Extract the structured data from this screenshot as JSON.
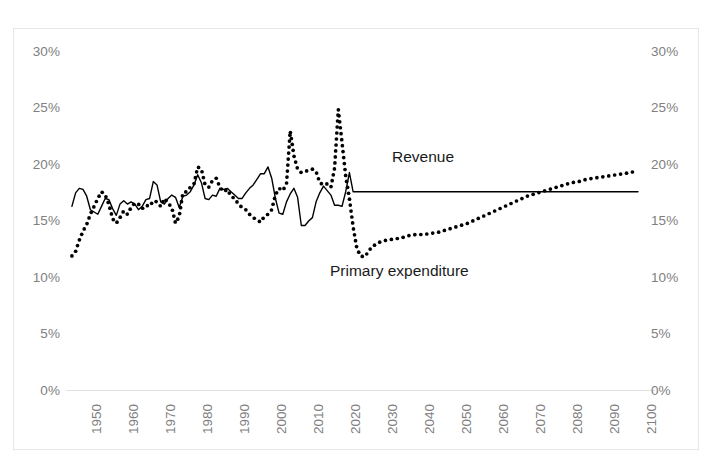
{
  "chart_data": {
    "type": "line",
    "title": "",
    "subtitle": "",
    "xlabel": "",
    "ylabel": "",
    "xlim": [
      1947,
      2100
    ],
    "ylim": [
      0,
      30
    ],
    "grid": false,
    "legend_position": "inline-annotation",
    "y_tick_labels": [
      "30%",
      "25%",
      "20%",
      "15%",
      "10%",
      "5%",
      "0%"
    ],
    "y_ticks": [
      30,
      25,
      20,
      15,
      10,
      5,
      0
    ],
    "y_axis_left_labels": [
      "30%",
      "25%",
      "20%",
      "15%",
      "10%",
      "5%",
      "0%"
    ],
    "y_axis_right_labels": [
      "30%",
      "25%",
      "20%",
      "15%",
      "10%",
      "5%",
      "0%"
    ],
    "x_tick_labels": [
      "1950",
      "1960",
      "1970",
      "1980",
      "1990",
      "2000",
      "2010",
      "2020",
      "2030",
      "2040",
      "2050",
      "2060",
      "2070",
      "2080",
      "2090",
      "2100"
    ],
    "x_ticks": [
      1950,
      1960,
      1970,
      1980,
      1990,
      2000,
      2010,
      2020,
      2030,
      2040,
      2050,
      2060,
      2070,
      2080,
      2090,
      2100
    ],
    "annotations": [
      {
        "text": "Revenue",
        "x": 2038,
        "y": 21.3
      },
      {
        "text": "Primary expenditure",
        "x": 2024,
        "y": 11.0
      }
    ],
    "colors": {
      "revenue_line": "#000000",
      "expenditure_line": "#000000",
      "axis_text": "#808080",
      "frame": "#e6e6e6",
      "background": "#ffffff"
    },
    "series": [
      {
        "name": "Revenue",
        "style": "solid",
        "x": [
          1947,
          1948,
          1949,
          1950,
          1951,
          1952,
          1953,
          1954,
          1955,
          1956,
          1957,
          1958,
          1959,
          1960,
          1961,
          1962,
          1963,
          1964,
          1965,
          1966,
          1967,
          1968,
          1969,
          1970,
          1971,
          1972,
          1973,
          1974,
          1975,
          1976,
          1977,
          1978,
          1979,
          1980,
          1981,
          1982,
          1983,
          1984,
          1985,
          1986,
          1987,
          1988,
          1989,
          1990,
          1991,
          1992,
          1993,
          1994,
          1995,
          1996,
          1997,
          1998,
          1999,
          2000,
          2001,
          2002,
          2003,
          2004,
          2005,
          2006,
          2007,
          2008,
          2009,
          2010,
          2011,
          2012,
          2013,
          2014,
          2015,
          2016,
          2017,
          2018,
          2019,
          2020,
          2021,
          2022,
          2023,
          2024,
          2025,
          2030,
          2035,
          2040,
          2045,
          2050,
          2055,
          2060,
          2065,
          2070,
          2075,
          2080,
          2085,
          2090,
          2095,
          2100
        ],
        "y": [
          16.3,
          17.5,
          17.9,
          17.8,
          17.2,
          16.0,
          15.8,
          15.6,
          16.3,
          17.0,
          16.9,
          16.1,
          15.5,
          16.5,
          16.8,
          16.5,
          16.7,
          16.5,
          16.0,
          16.3,
          16.9,
          17.0,
          18.5,
          18.2,
          16.7,
          16.5,
          17.0,
          17.3,
          17.1,
          16.2,
          17.2,
          17.3,
          17.6,
          18.2,
          19.1,
          18.4,
          17.0,
          16.9,
          17.3,
          17.2,
          17.9,
          17.8,
          17.9,
          17.6,
          17.3,
          17.0,
          17.0,
          17.5,
          17.9,
          18.2,
          18.7,
          19.2,
          19.2,
          19.8,
          18.8,
          17.0,
          15.7,
          15.6,
          16.7,
          17.4,
          17.9,
          17.1,
          14.6,
          14.6,
          15.0,
          15.3,
          16.7,
          17.5,
          18.1,
          17.7,
          17.3,
          16.4,
          16.4,
          16.3,
          17.6,
          19.3,
          17.6,
          17.6,
          17.6,
          17.6,
          17.6,
          17.6,
          17.6,
          17.6,
          17.6,
          17.6,
          17.6,
          17.6,
          17.6,
          17.6,
          17.6,
          17.6,
          17.6,
          17.6
        ]
      },
      {
        "name": "Primary expenditure",
        "style": "dotted",
        "x": [
          1947,
          1948,
          1949,
          1950,
          1951,
          1952,
          1953,
          1954,
          1955,
          1956,
          1957,
          1958,
          1959,
          1960,
          1961,
          1962,
          1963,
          1964,
          1965,
          1966,
          1967,
          1968,
          1969,
          1970,
          1971,
          1972,
          1973,
          1974,
          1975,
          1976,
          1977,
          1978,
          1979,
          1980,
          1981,
          1982,
          1983,
          1984,
          1985,
          1986,
          1987,
          1988,
          1989,
          1990,
          1991,
          1992,
          1993,
          1994,
          1995,
          1996,
          1997,
          1998,
          1999,
          2000,
          2001,
          2002,
          2003,
          2004,
          2005,
          2006,
          2007,
          2008,
          2009,
          2010,
          2011,
          2012,
          2013,
          2014,
          2015,
          2016,
          2017,
          2018,
          2019,
          2020,
          2021,
          2022,
          2023,
          2024,
          2025,
          2026,
          2027,
          2028,
          2030,
          2032,
          2034,
          2036,
          2038,
          2040,
          2042,
          2044,
          2046,
          2048,
          2050,
          2052,
          2054,
          2056,
          2058,
          2060,
          2062,
          2064,
          2066,
          2068,
          2070,
          2072,
          2074,
          2076,
          2078,
          2080,
          2082,
          2084,
          2086,
          2088,
          2090,
          2092,
          2094,
          2096,
          2098,
          2100
        ],
        "y": [
          11.9,
          12.3,
          13.3,
          14.1,
          14.7,
          15.6,
          16.3,
          17.0,
          17.6,
          17.3,
          16.5,
          15.2,
          14.8,
          15.3,
          15.9,
          15.6,
          16.2,
          16.6,
          16.5,
          16.1,
          16.4,
          16.3,
          16.8,
          16.7,
          16.3,
          17.0,
          16.6,
          16.2,
          14.8,
          15.4,
          17.5,
          17.6,
          18.0,
          18.3,
          19.8,
          19.6,
          18.2,
          18.0,
          18.6,
          18.8,
          18.0,
          17.6,
          17.8,
          17.2,
          17.0,
          16.5,
          16.2,
          16.0,
          15.6,
          15.3,
          15.1,
          14.9,
          15.4,
          15.6,
          16.0,
          17.3,
          17.9,
          17.7,
          18.3,
          23.0,
          20.8,
          19.6,
          19.3,
          19.4,
          19.5,
          19.6,
          19.4,
          18.4,
          18.2,
          18.3,
          18.0,
          19.7,
          24.9,
          22.0,
          19.0,
          17.0,
          14.5,
          12.6,
          11.9,
          11.8,
          12.2,
          12.7,
          13.1,
          13.3,
          13.4,
          13.5,
          13.7,
          13.8,
          13.8,
          13.9,
          14.0,
          14.2,
          14.4,
          14.6,
          14.8,
          15.1,
          15.4,
          15.7,
          16.0,
          16.3,
          16.6,
          16.9,
          17.2,
          17.4,
          17.6,
          17.8,
          18.0,
          18.2,
          18.4,
          18.5,
          18.7,
          18.8,
          18.9,
          19.0,
          19.1,
          19.2,
          19.3,
          19.5
        ]
      }
    ]
  }
}
